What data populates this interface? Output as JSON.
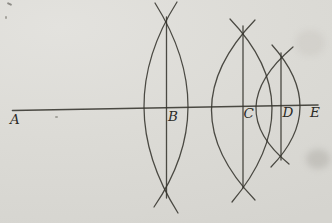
{
  "figure": {
    "paper_color": "#dcdbd6",
    "ink_color": "#36342e",
    "point_names": [
      "A",
      "B",
      "C",
      "D",
      "E"
    ],
    "axis_line": {
      "x1": 12.5,
      "y1": 110.5,
      "x2": 318,
      "y2": 105
    },
    "labels": [
      {
        "text": "A",
        "x": 10,
        "y": 124
      },
      {
        "text": "B",
        "x": 168,
        "y": 121
      },
      {
        "text": "C",
        "x": 243.5,
        "y": 118
      },
      {
        "text": "D",
        "x": 282.5,
        "y": 117
      },
      {
        "text": "E",
        "x": 310,
        "y": 117
      }
    ],
    "lenses": [
      {
        "name": "lens-B",
        "vertical_line": {
          "x": 166.5,
          "y1": 17,
          "y2": 198
        },
        "left_arc": {
          "p0": [
            177,
            2
          ],
          "ctrl": [
            110.5,
            106.5
          ],
          "p1": [
            178,
            213
          ]
        },
        "right_arc": {
          "p0": [
            155,
            3
          ],
          "ctrl": [
            221.5,
            109
          ],
          "p1": [
            154,
            207
          ]
        }
      },
      {
        "name": "lens-C",
        "vertical_line": {
          "x": 243,
          "y1": 26,
          "y2": 188
        },
        "left_arc": {
          "p0": [
            255,
            20
          ],
          "ctrl": [
            168,
            110
          ],
          "p1": [
            255,
            200
          ]
        },
        "right_arc": {
          "p0": [
            230,
            19
          ],
          "ctrl": [
            313,
            105.5
          ],
          "p1": [
            232,
            202
          ]
        }
      },
      {
        "name": "lens-D",
        "vertical_line": {
          "x": 281,
          "y1": 53,
          "y2": 160
        },
        "left_arc": {
          "p0": [
            293,
            47
          ],
          "ctrl": [
            221,
            108.5
          ],
          "p1": [
            289,
            164
          ]
        },
        "right_arc": {
          "p0": [
            272,
            45
          ],
          "ctrl": [
            328.5,
            108
          ],
          "p1": [
            271,
            167
          ]
        }
      }
    ]
  }
}
